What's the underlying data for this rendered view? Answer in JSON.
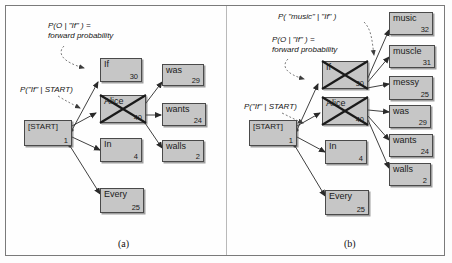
{
  "figure": {
    "caption_a": "(a)",
    "caption_b": "(b)",
    "colors": {
      "node_fill": "#c6c6c6",
      "node_border": "#4a4a4a",
      "frame": "#7a7a7a",
      "divider": "#b9b9b9",
      "edge": "#2a2a2a",
      "text": "#141414"
    }
  },
  "panel_a": {
    "nodes": [
      {
        "id": "start",
        "label": "[START]",
        "value": "1",
        "crossed": false
      },
      {
        "id": "if",
        "label": "If",
        "value": "30",
        "crossed": false
      },
      {
        "id": "alice",
        "label": "Alice",
        "value": "40",
        "crossed": true
      },
      {
        "id": "in",
        "label": "In",
        "value": "4",
        "crossed": false
      },
      {
        "id": "every",
        "label": "Every",
        "value": "25",
        "crossed": false
      },
      {
        "id": "was",
        "label": "was",
        "value": "29",
        "crossed": false
      },
      {
        "id": "wants",
        "label": "wants",
        "value": "24",
        "crossed": false
      },
      {
        "id": "walls",
        "label": "walls",
        "value": "2",
        "crossed": false
      }
    ],
    "annotations": [
      {
        "id": "forward",
        "line1": "P(O | \"If\" ) =",
        "line2": "forward probability"
      },
      {
        "id": "transition",
        "line1": "P(\"If\" | START)",
        "line2": ""
      }
    ]
  },
  "panel_b": {
    "nodes": [
      {
        "id": "start",
        "label": "[START]",
        "value": "1",
        "crossed": false
      },
      {
        "id": "if",
        "label": "If",
        "value": "30",
        "crossed": true
      },
      {
        "id": "alice",
        "label": "Alice",
        "value": "40",
        "crossed": true
      },
      {
        "id": "in",
        "label": "In",
        "value": "4",
        "crossed": false
      },
      {
        "id": "every",
        "label": "Every",
        "value": "25",
        "crossed": false
      },
      {
        "id": "music",
        "label": "music",
        "value": "32",
        "crossed": false
      },
      {
        "id": "muscle",
        "label": "muscle",
        "value": "31",
        "crossed": false
      },
      {
        "id": "messy",
        "label": "messy",
        "value": "25",
        "crossed": false
      },
      {
        "id": "was",
        "label": "was",
        "value": "29",
        "crossed": false
      },
      {
        "id": "wants",
        "label": "wants",
        "value": "24",
        "crossed": false
      },
      {
        "id": "walls",
        "label": "walls",
        "value": "2",
        "crossed": false
      }
    ],
    "annotations": [
      {
        "id": "emission",
        "line1": "P( \"music\" | \"If\" )",
        "line2": ""
      },
      {
        "id": "forward",
        "line1": "P(O | \"If\" ) =",
        "line2": "forward probability"
      },
      {
        "id": "transition",
        "line1": "P(\"If\" | START)",
        "line2": ""
      }
    ]
  }
}
